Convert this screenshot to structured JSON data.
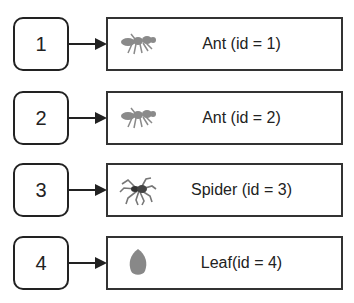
{
  "diagram": {
    "rows": [
      {
        "index": "1",
        "label": "Ant (id = 1)",
        "icon": "ant-icon"
      },
      {
        "index": "2",
        "label": "Ant (id = 2)",
        "icon": "ant-icon"
      },
      {
        "index": "3",
        "label": "Spider (id = 3)",
        "icon": "spider-icon"
      },
      {
        "index": "4",
        "label": "Leaf(id = 4)",
        "icon": "leaf-icon"
      }
    ]
  }
}
